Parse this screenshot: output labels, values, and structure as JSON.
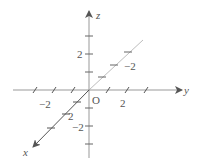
{
  "diagram": {
    "origin_label": "O",
    "axes": {
      "x": {
        "label": "x",
        "tick_label_pos": "2"
      },
      "y": {
        "label": "y",
        "tick_label_neg": "−2",
        "tick_label_pos": "2"
      },
      "z": {
        "label": "z",
        "tick_label_pos": "2",
        "tick_label_neg": "−2"
      },
      "x_negative": {
        "tick_label": "−2"
      }
    },
    "colors": {
      "axis": "#666666",
      "back_axis": "#bbbbbb",
      "text": "#555555"
    }
  }
}
